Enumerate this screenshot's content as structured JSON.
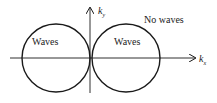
{
  "diagram": {
    "axes": {
      "x_label": "k",
      "x_sub": "x",
      "y_label": "k",
      "y_sub": "y"
    },
    "regions": [
      {
        "label": "Waves",
        "position": "left circle"
      },
      {
        "label": "Waves",
        "position": "right circle"
      },
      {
        "label": "No waves",
        "position": "outside circles"
      }
    ],
    "colors": {
      "stroke": "#1a1a1a",
      "background": "#ffffff"
    }
  }
}
